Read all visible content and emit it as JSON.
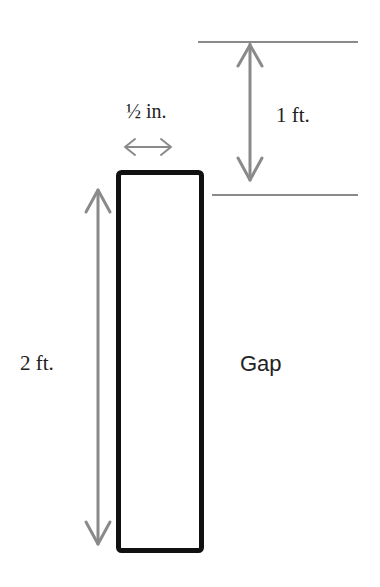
{
  "diagram": {
    "labels": {
      "width": "½ in.",
      "top_gap": "1 ft.",
      "height": "2 ft.",
      "gap": "Gap"
    },
    "colors": {
      "board": "#111111",
      "dimension": "#8a8a8a",
      "text": "#222222"
    }
  }
}
